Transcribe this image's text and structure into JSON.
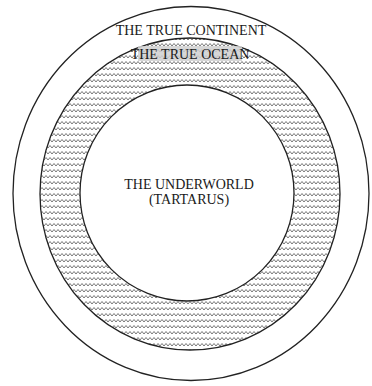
{
  "diagram": {
    "regions": {
      "continent": {
        "label": "THE TRUE CONTINENT"
      },
      "ocean": {
        "label": "THE TRUE OCEAN"
      },
      "underworld": {
        "line1": "THE UNDERWORLD",
        "line2": "(TARTARUS)"
      }
    },
    "colors": {
      "stroke": "#222222",
      "wave": "#555555",
      "ocean_label_bg": "#d0d0d0",
      "background": "#ffffff"
    }
  }
}
